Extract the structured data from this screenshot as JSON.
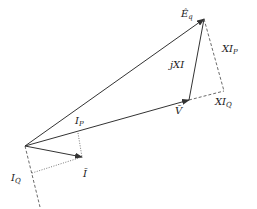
{
  "diagram": {
    "colors": {
      "stroke": "#333333",
      "background": "#ffffff"
    },
    "labels": {
      "eq": {
        "main": "Ê",
        "sub": "q"
      },
      "jxi": "jXI",
      "xip": {
        "main": "XI",
        "sub": "P"
      },
      "v": "V̄",
      "xiq": {
        "main": "XI",
        "sub": "Q"
      },
      "ip": {
        "main": "I",
        "sub": "P"
      },
      "iq": {
        "main": "I",
        "sub": "Q"
      },
      "i": "Ī"
    }
  }
}
